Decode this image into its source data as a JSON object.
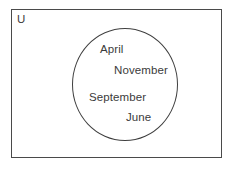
{
  "diagram": {
    "type": "venn-diagram",
    "universe": {
      "label": "U",
      "name": "universal-set"
    },
    "sets": [
      {
        "name": "month-set",
        "label": "",
        "members": [
          {
            "label": "April"
          },
          {
            "label": "November"
          },
          {
            "label": "September"
          },
          {
            "label": "June"
          }
        ]
      }
    ],
    "colors": {
      "background": "#ffffff",
      "rect_border": "#4a4a4a",
      "circle_border": "#3f3f3f",
      "text": "#3b3b3b"
    }
  }
}
